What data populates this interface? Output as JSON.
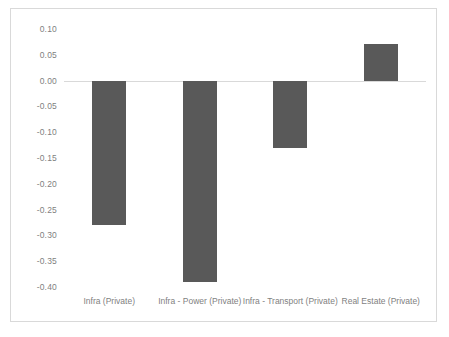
{
  "chart_data": {
    "type": "bar",
    "title": "",
    "subtitle": "",
    "xlabel": "",
    "ylabel": "",
    "categories": [
      "Infra (Private)",
      "Infra - Power (Private)",
      "Infra - Transport (Private)",
      "Real Estate (Private)"
    ],
    "values": [
      -0.28,
      -0.39,
      -0.13,
      0.07
    ],
    "ylim": [
      -0.4,
      0.1
    ],
    "yticks": [
      0.1,
      0.05,
      0.0,
      -0.05,
      -0.1,
      -0.15,
      -0.2,
      -0.25,
      -0.3,
      -0.35,
      -0.4
    ],
    "ytick_labels": [
      "0.10",
      "0.05",
      "0.00",
      "-0.05",
      "-0.10",
      "-0.15",
      "-0.20",
      "-0.25",
      "-0.30",
      "-0.35",
      "-0.40"
    ],
    "grid": false,
    "zero_line": true,
    "legend": null,
    "series": [
      {
        "name": "",
        "values": [
          -0.28,
          -0.39,
          -0.13,
          0.07
        ]
      }
    ],
    "colors": {
      "bar": "#595959",
      "axis_text": "#7f7f7f",
      "zero_line": "#d9d9d9",
      "frame_border": "#d9d9d9",
      "background": "#ffffff"
    }
  }
}
